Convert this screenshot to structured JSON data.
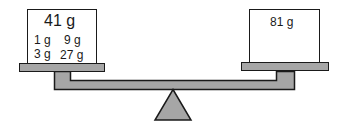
{
  "scale": {
    "left_pan": {
      "total_label": "41 g",
      "weights": [
        "1 g",
        "9 g",
        "3 g",
        "27 g"
      ]
    },
    "right_pan": {
      "total_label": "81 g"
    }
  },
  "colors": {
    "fill_gray": "#a6a6a6",
    "stroke": "#1a1a1a",
    "box_fill": "#ffffff"
  }
}
